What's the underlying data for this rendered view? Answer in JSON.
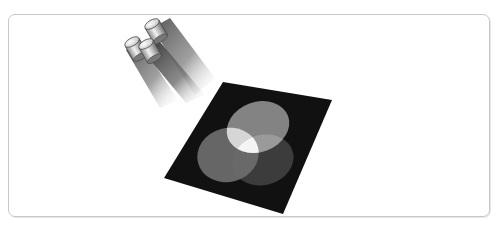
{
  "figure": {
    "colors": {
      "background": "#ffffff",
      "frame_border": "#c8c8c8",
      "surface": "#111111",
      "spot_top": "#8a8a8a",
      "spot_left": "#6e6e6e",
      "spot_right": "#3c3c3c",
      "overlap_center": "#f4f4f4"
    },
    "lights": [
      {
        "name": "top-spotlight"
      },
      {
        "name": "left-spotlight"
      },
      {
        "name": "middle-spotlight"
      }
    ]
  }
}
